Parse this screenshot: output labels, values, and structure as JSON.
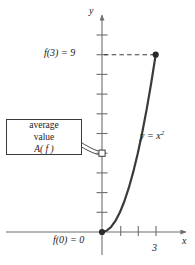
{
  "figure": {
    "axes": {
      "x_name": "x",
      "y_name": "y",
      "origin_label": "0"
    },
    "labels": {
      "f3": "f(3)  =  9",
      "f0": "f(0)  =  0",
      "x_tick_3": "3",
      "curve_equation_lhs": "y  =  x",
      "curve_equation_exp": "2"
    },
    "callout": {
      "line1": "average",
      "line2_text": "value A( f )",
      "line2_word": "value",
      "line2_fn": "A( f )"
    },
    "colors": {
      "axis": "#6e6e6e",
      "curve": "#3a3a3a",
      "dash": "#3a3a3a",
      "box_border": "#3a3a3a",
      "text": "#1a1a1a",
      "background": "#ffffff"
    }
  },
  "chart_data": {
    "type": "line",
    "title": "",
    "xlabel": "x",
    "ylabel": "y",
    "function": "y = x^2",
    "domain": [
      0,
      3
    ],
    "xlim": [
      -0.35,
      4.9
    ],
    "ylim": [
      -1.1,
      10.2
    ],
    "grid": false,
    "legend": null,
    "x_ticks": [
      1,
      2,
      3
    ],
    "x_tick_labels": [
      "",
      "",
      "3"
    ],
    "y_ticks": [
      1,
      2,
      3,
      4,
      5,
      6,
      7,
      8,
      9,
      10
    ],
    "y_tick_labels": [
      "",
      "",
      "",
      "",
      "",
      "",
      "",
      "",
      "9",
      ""
    ],
    "x": [
      0,
      0.25,
      0.5,
      0.75,
      1,
      1.25,
      1.5,
      1.75,
      2,
      2.25,
      2.5,
      2.75,
      3
    ],
    "y": [
      0,
      0.0625,
      0.25,
      0.5625,
      1,
      1.5625,
      2.25,
      3.0625,
      4,
      5.0625,
      6.25,
      7.5625,
      9
    ],
    "points": [
      {
        "name": "f(0) = 0",
        "x": 0,
        "y": 0,
        "marker": "filled-dot"
      },
      {
        "name": "f(3) = 9",
        "x": 3,
        "y": 9,
        "marker": "filled-dot"
      },
      {
        "name": "average value A(f)",
        "x": 0,
        "y": 4,
        "marker": "open-square"
      }
    ],
    "annotations": [
      {
        "text": "f(3)  =  9",
        "x": 0,
        "y": 9,
        "placement": "left-of-axis"
      },
      {
        "text": "f(0)  =  0",
        "x": 0,
        "y": 0,
        "placement": "below-left-of-origin"
      },
      {
        "text": "y = x²",
        "x": 3.3,
        "y": 5.2,
        "placement": "right-of-curve"
      },
      {
        "text": "average value A( f )",
        "x": -2.6,
        "y": 4.2,
        "placement": "boxed-callout-with-leader"
      }
    ],
    "dashed_guides": [
      {
        "from": [
          0,
          9
        ],
        "to": [
          3,
          9
        ],
        "style": "dashed"
      }
    ]
  }
}
